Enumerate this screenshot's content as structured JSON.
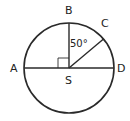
{
  "diagram": {
    "type": "circle-geometry",
    "colors": {
      "stroke": "#2a2a2a",
      "text": "#222222",
      "background": "#ffffff"
    },
    "circle": {
      "center_label": "S",
      "cx": 69,
      "cy": 68,
      "r": 45
    },
    "points": {
      "A": {
        "label": "A"
      },
      "B": {
        "label": "B"
      },
      "C": {
        "label": "C"
      },
      "D": {
        "label": "D"
      },
      "S": {
        "label": "S"
      }
    },
    "segments": [
      "AD",
      "SB",
      "SC"
    ],
    "angles": {
      "BSC": {
        "label": "50°"
      },
      "ASB": {
        "label": "right angle"
      }
    }
  }
}
